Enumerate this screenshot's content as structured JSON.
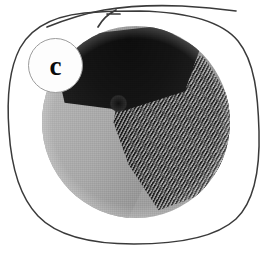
{
  "figure": {
    "panel_label": "c",
    "kind": "micrograph-panel",
    "outline_shape": "hand-drawn-rounded-square",
    "annotations": {
      "arrow": {
        "name": "pointer-arrow",
        "direction": "right",
        "description": "hand-drawn arrow at top of panel pointing right"
      }
    },
    "colors": {
      "outline": "#3a3a3a",
      "arrow": "#3a3a3a",
      "badge_fill": "#fdfdfd",
      "badge_border": "#9b9b9b",
      "label_text": "#0a0a0a",
      "background": "#ffffff",
      "dark_region": "#141414",
      "mid_region": "#4a4a4a",
      "light_region": "#a8a8a8"
    },
    "regions": [
      {
        "name": "dark-cap",
        "tone": "near-black",
        "position": "top"
      },
      {
        "name": "smooth-facet",
        "tone": "light-grey",
        "position": "lower-left"
      },
      {
        "name": "striated-wedge",
        "tone": "dark-grey",
        "position": "right",
        "texture": "fine diagonal striations"
      }
    ]
  }
}
